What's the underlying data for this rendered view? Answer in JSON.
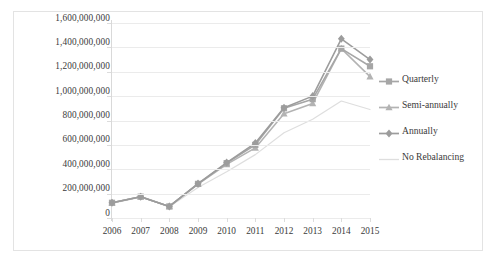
{
  "chart_data": {
    "type": "line",
    "title": "",
    "subtitle": "",
    "xlabel": "",
    "ylabel": "",
    "categories": [
      "2006",
      "2007",
      "2008",
      "2009",
      "2010",
      "2011",
      "2012",
      "2013",
      "2014",
      "2015"
    ],
    "x_tick_labels": [
      "2006",
      "2007",
      "2008",
      "2009",
      "2010",
      "2011",
      "2012",
      "2013",
      "2014",
      "2015"
    ],
    "y_tick_labels": [
      "1,600,000,000",
      "1,400,000,000",
      "1,200,000,000",
      "1,000,000,000",
      "800,000,000",
      "600,000,000",
      "400,000,000",
      "200,000,000",
      "0"
    ],
    "y_tick_values": [
      1600000000,
      1400000000,
      1200000000,
      1000000000,
      800000000,
      600000000,
      400000000,
      200000000,
      0
    ],
    "ylim": [
      0,
      1600000000
    ],
    "xlim": [
      "2006",
      "2015"
    ],
    "grid": "horizontal",
    "legend_position": "right",
    "series": [
      {
        "name": "Quarterly",
        "marker": "square",
        "color": "#a6a6a6",
        "values": [
          125000000,
          175000000,
          95000000,
          280000000,
          450000000,
          600000000,
          900000000,
          975000000,
          1390000000,
          1245000000
        ]
      },
      {
        "name": "Semi-annually",
        "marker": "triangle",
        "color": "#b3b3b3",
        "values": [
          125000000,
          175000000,
          95000000,
          278000000,
          440000000,
          575000000,
          855000000,
          940000000,
          1390000000,
          1160000000
        ]
      },
      {
        "name": "Annually",
        "marker": "diamond",
        "color": "#9c9c9c",
        "values": [
          125000000,
          175000000,
          95000000,
          282000000,
          455000000,
          615000000,
          905000000,
          1000000000,
          1470000000,
          1300000000
        ]
      },
      {
        "name": "No Rebalancing",
        "marker": "none",
        "color": "#dedede",
        "values": [
          120000000,
          170000000,
          92000000,
          250000000,
          380000000,
          520000000,
          700000000,
          810000000,
          960000000,
          890000000
        ]
      }
    ]
  },
  "legend": {
    "items": [
      {
        "label": "Quarterly",
        "marker": "square-marker",
        "color": "#a6a6a6"
      },
      {
        "label": "Semi-annually",
        "marker": "triangle-marker",
        "color": "#b3b3b3"
      },
      {
        "label": "Annually",
        "marker": "diamond-marker",
        "color": "#9c9c9c"
      },
      {
        "label": "No Rebalancing",
        "marker": "line-only",
        "color": "#dedede"
      }
    ]
  },
  "colors": {
    "gridline": "#ebebeb",
    "axis": "#d9d9d9",
    "frame": "#e3e3e3",
    "text": "#3a3a3a",
    "background": "#ffffff"
  }
}
